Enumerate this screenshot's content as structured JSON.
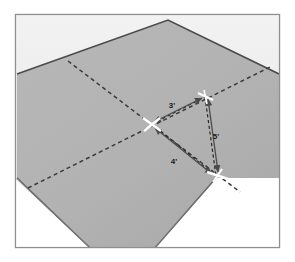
{
  "figure": {
    "frame": {
      "border_color": "#8c8c8c",
      "background_color": "#ffffff",
      "x": 15,
      "y": 14,
      "width": 265,
      "height": 234
    },
    "wall_region": {
      "name": "upper-wall-area",
      "fill_color": "#ededed"
    },
    "floor_region": {
      "name": "floor-surface",
      "fill_color": "#b3b3b3",
      "edge_color": "#5a5a5a",
      "points": "17,178 17,74 168,20 279,74 279,178 216,178 155,248 90,248"
    },
    "chalk_lines": [
      {
        "name": "chalk-line-a",
        "from_x": 68,
        "from_y": 61,
        "to_x": 236,
        "to_y": 188,
        "color": "#3a3a3a",
        "dash": "4 3"
      },
      {
        "name": "chalk-line-b",
        "from_x": 30,
        "from_y": 187,
        "to_x": 268,
        "to_y": 68,
        "color": "#3a3a3a",
        "dash": "4 3"
      }
    ],
    "center_mark": {
      "name": "chalk-intersection-mark",
      "x": 152,
      "y": 124,
      "color": "#ffffff"
    },
    "triangle": {
      "vertex_center": {
        "x": 152,
        "y": 124
      },
      "vertex_top": {
        "x": 205,
        "y": 97
      },
      "vertex_bottom": {
        "x": 216,
        "y": 176
      },
      "mark_color": "#ffffff",
      "arrow_color": "#4d4d4d",
      "guide_color": "#2b2b2b"
    },
    "dimensions": [
      {
        "name": "dimension-3ft",
        "label": "3'",
        "label_x": 172,
        "label_y": 108,
        "value": 3,
        "unit": "ft"
      },
      {
        "name": "dimension-4ft",
        "label": "4'",
        "label_x": 174,
        "label_y": 163,
        "value": 4,
        "unit": "ft"
      },
      {
        "name": "dimension-5ft",
        "label": "5'",
        "label_x": 215,
        "label_y": 137,
        "value": 5,
        "unit": "ft"
      }
    ]
  }
}
